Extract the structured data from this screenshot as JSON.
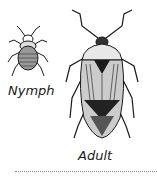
{
  "figure": {
    "nymph": {
      "label": "Nymph",
      "icon": "nymph-bug-icon"
    },
    "adult": {
      "label": "Adult",
      "icon": "adult-bug-icon"
    }
  },
  "colors": {
    "ink": "#1a1a1a",
    "shade": "#555555",
    "background": "#ffffff"
  }
}
